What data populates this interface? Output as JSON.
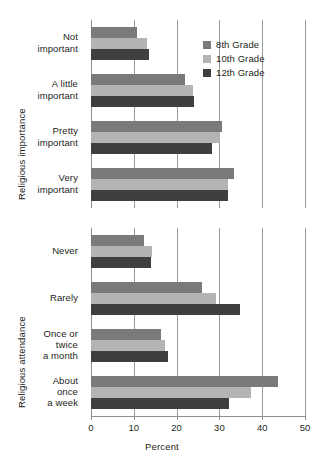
{
  "chart_data": {
    "type": "bar",
    "orientation": "horizontal",
    "title": "",
    "xlabel": "Percent",
    "ylabel": "",
    "xlim": [
      0,
      50
    ],
    "xticks": [
      0,
      10,
      20,
      30,
      40,
      50
    ],
    "xtick_labels": [
      "0",
      "10",
      "20",
      "30",
      "40",
      "50"
    ],
    "grid": true,
    "legend_position": "top-right",
    "series": [
      {
        "name": "8th Grade",
        "color": "#7a7a7a"
      },
      {
        "name": "10th Grade",
        "color": "#b4b4b4"
      },
      {
        "name": "12th Grade",
        "color": "#3f3f3f"
      }
    ],
    "panels": [
      {
        "ylabel": "Religious importance",
        "categories": [
          "Not important",
          "A little important",
          "Pretty important",
          "Very important"
        ],
        "category_lines": [
          [
            "Not",
            "important"
          ],
          [
            "A little",
            "important"
          ],
          [
            "Pretty",
            "important"
          ],
          [
            "Very",
            "important"
          ]
        ],
        "values": {
          "8th Grade": [
            10.8,
            22.0,
            30.7,
            33.4
          ],
          "10th Grade": [
            13.0,
            23.8,
            30.2,
            32.0
          ],
          "12th Grade": [
            13.5,
            24.0,
            28.3,
            32.0
          ]
        }
      },
      {
        "ylabel": "Religious attendance",
        "categories": [
          "Never",
          "Rarely",
          "Once or twice a month",
          "About once a week"
        ],
        "category_lines": [
          [
            "Never"
          ],
          [
            "Rarely"
          ],
          [
            "Once or",
            "twice",
            "a month"
          ],
          [
            "About",
            "once",
            "a week"
          ]
        ],
        "values": {
          "8th Grade": [
            12.4,
            26.0,
            16.4,
            43.7
          ],
          "10th Grade": [
            14.3,
            29.2,
            17.3,
            37.4
          ],
          "12th Grade": [
            14.0,
            34.8,
            18.0,
            32.2
          ]
        }
      }
    ]
  },
  "legend": {
    "items": [
      {
        "label": "8th Grade"
      },
      {
        "label": "10th Grade"
      },
      {
        "label": "12th Grade"
      }
    ]
  },
  "axes": {
    "x_title": "Percent",
    "y_title_top": "Religious importance",
    "y_title_bottom": "Religious attendance"
  }
}
